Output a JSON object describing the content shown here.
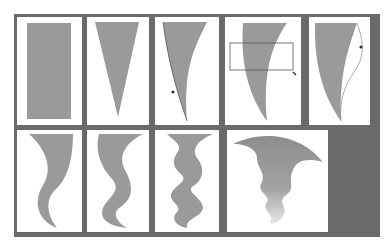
{
  "figure": {
    "colors": {
      "frame": "#6a6a6a",
      "panel": "#ffffff",
      "shape_fill": "#9a9a9a",
      "outline": "#555555"
    },
    "rows": [
      {
        "panels": [
          {
            "step": 1,
            "shape": "rectangle"
          },
          {
            "step": 2,
            "shape": "inverted-triangle"
          },
          {
            "step": 3,
            "shape": "curved-triangle",
            "overlay": "bezier-handle-path"
          },
          {
            "step": 4,
            "shape": "curved-horn",
            "overlay": "selection-rectangle"
          },
          {
            "step": 5,
            "shape": "curved-horn",
            "overlay": "bezier-handle-path"
          }
        ]
      },
      {
        "panels": [
          {
            "step": 6,
            "shape": "s-curve-tail"
          },
          {
            "step": 7,
            "shape": "double-wave-tail"
          },
          {
            "step": 8,
            "shape": "multi-wave-tail"
          },
          {
            "step": 9,
            "shape": "smoke-plume-gradient"
          }
        ]
      }
    ]
  }
}
